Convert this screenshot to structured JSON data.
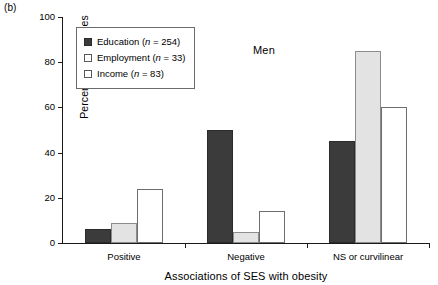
{
  "panel": {
    "label": "(b)"
  },
  "annotation": {
    "men": "Men"
  },
  "legend": {
    "items": [
      {
        "series": "education",
        "label": "Education (n = 254)"
      },
      {
        "series": "employment",
        "label": "Employment (n = 33)"
      },
      {
        "series": "income",
        "label": "Income (n = 83)"
      }
    ]
  },
  "axes": {
    "y_title": "Percentage of studies",
    "x_title": "Associations of SES with obesity",
    "y_ticks": [
      "0",
      "20",
      "40",
      "60",
      "80",
      "100"
    ]
  },
  "chart_data": {
    "type": "bar",
    "title": "Men",
    "subtitle": "(b)",
    "categories": [
      "Positive",
      "Negative",
      "NS or curvilinear"
    ],
    "series": [
      {
        "name": "Education (n = 254)",
        "key": "education",
        "values": [
          6,
          50,
          45
        ],
        "color": "#3b3b3b"
      },
      {
        "name": "Employment (n = 33)",
        "key": "employment",
        "values": [
          9,
          5,
          85
        ],
        "color": "#e3e3e3"
      },
      {
        "name": "Income (n = 83)",
        "key": "income",
        "values": [
          24,
          14,
          60
        ],
        "color": "#ffffff"
      }
    ],
    "xlabel": "Associations of SES with obesity",
    "ylabel": "Percentage of studies",
    "ylim": [
      0,
      100
    ],
    "ytick_step": 20,
    "grid": false,
    "legend_position": "top-left",
    "n_education": 254,
    "n_employment": 33,
    "n_income": 83
  }
}
